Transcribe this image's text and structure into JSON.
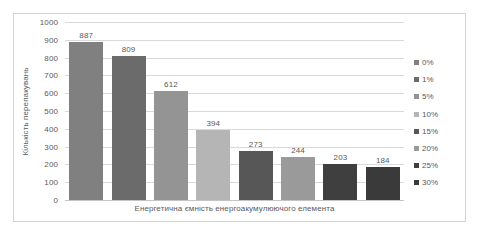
{
  "chart_data": {
    "type": "bar",
    "title": "",
    "subtitle": "",
    "xlabel": "Енергетична ємність енергоакумулюючого елемента",
    "ylabel": "Кількість перепакувань",
    "categories": [
      "0%",
      "1%",
      "5%",
      "10%",
      "15%",
      "20%",
      "25%",
      "30%"
    ],
    "values": [
      887,
      809,
      612,
      394,
      273,
      244,
      203,
      184
    ],
    "data_labels": [
      "887",
      "809",
      "612",
      "394",
      "273",
      "244",
      "203",
      "184"
    ],
    "bar_colors": [
      "#808080",
      "#6b6b6b",
      "#949494",
      "#b5b5b5",
      "#575757",
      "#9a9a9a",
      "#3f3f3f",
      "#3a3a3a"
    ],
    "ylim": [
      0,
      1000
    ],
    "ytick_step": 100,
    "ytick_labels": [
      "1000",
      "900",
      "800",
      "700",
      "600",
      "500",
      "400",
      "300",
      "200",
      "100",
      "0"
    ],
    "ytick_values": [
      1000,
      900,
      800,
      700,
      600,
      500,
      400,
      300,
      200,
      100,
      0
    ],
    "grid": true,
    "grid_axis": "y",
    "legend_position": "right",
    "legend": [
      {
        "label": "0%",
        "color": "#808080"
      },
      {
        "label": "1%",
        "color": "#6b6b6b"
      },
      {
        "label": "5%",
        "color": "#949494"
      },
      {
        "label": "10%",
        "color": "#b5b5b5"
      },
      {
        "label": "15%",
        "color": "#575757"
      },
      {
        "label": "20%",
        "color": "#9a9a9a"
      },
      {
        "label": "25%",
        "color": "#3f3f3f"
      },
      {
        "label": "30%",
        "color": "#3a3a3a"
      }
    ],
    "text_color": "#59595b",
    "gridline_color": "#d9d9d9",
    "border_color": "#d4d4d4",
    "background": "#ffffff"
  }
}
